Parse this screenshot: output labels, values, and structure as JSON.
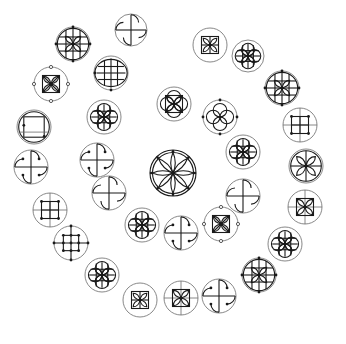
{
  "diagram": {
    "title": "",
    "background": "#ffffff",
    "stroke_color": "#1a1a1a",
    "outline_color": "#6a6a6a",
    "layout": "concentric-rings",
    "center_symbol": {
      "x": 173,
      "y": 173,
      "r": 23,
      "type": "rosette"
    },
    "symbols": [
      {
        "ring": "outer",
        "x": 73,
        "y": 44,
        "r": 17,
        "type": "lattice-petals"
      },
      {
        "ring": "outer",
        "x": 51,
        "y": 84,
        "r": 17,
        "type": "square-x-dots"
      },
      {
        "ring": "outer",
        "x": 131,
        "y": 30,
        "r": 16,
        "type": "pinwheel"
      },
      {
        "ring": "outer",
        "x": 210,
        "y": 45,
        "r": 17,
        "type": "square-pinwheel"
      },
      {
        "ring": "outer",
        "x": 248,
        "y": 56,
        "r": 16,
        "type": "lattice-petals-circles"
      },
      {
        "ring": "outer",
        "x": 282,
        "y": 88,
        "r": 17,
        "type": "lattice-petals"
      },
      {
        "ring": "outer",
        "x": 300,
        "y": 125,
        "r": 17,
        "type": "lattice-dots"
      },
      {
        "ring": "outer",
        "x": 306,
        "y": 166,
        "r": 17,
        "type": "petal-cross"
      },
      {
        "ring": "outer",
        "x": 305,
        "y": 207,
        "r": 17,
        "type": "square-x-cross"
      },
      {
        "ring": "outer",
        "x": 285,
        "y": 244,
        "r": 17,
        "type": "lattice-petals-circles"
      },
      {
        "ring": "outer",
        "x": 259,
        "y": 275,
        "r": 17,
        "type": "lattice-petals"
      },
      {
        "ring": "outer",
        "x": 219,
        "y": 296,
        "r": 17,
        "type": "pinwheel-dots"
      },
      {
        "ring": "outer",
        "x": 181,
        "y": 298,
        "r": 17,
        "type": "square-x-cross"
      },
      {
        "ring": "outer",
        "x": 140,
        "y": 300,
        "r": 17,
        "type": "square-pinwheel"
      },
      {
        "ring": "outer",
        "x": 102,
        "y": 275,
        "r": 17,
        "type": "lattice-petals-circles"
      },
      {
        "ring": "outer",
        "x": 71,
        "y": 243,
        "r": 17,
        "type": "lattice-dots-cross"
      },
      {
        "ring": "outer",
        "x": 50,
        "y": 210,
        "r": 17,
        "type": "lattice-dots"
      },
      {
        "ring": "outer",
        "x": 31,
        "y": 167,
        "r": 17,
        "type": "pinwheel-dots"
      },
      {
        "ring": "outer",
        "x": 34,
        "y": 127,
        "r": 17,
        "type": "square-circle"
      },
      {
        "ring": "middle",
        "x": 111,
        "y": 73,
        "r": 17,
        "type": "lattice-circle"
      },
      {
        "ring": "middle",
        "x": 104,
        "y": 117,
        "r": 17,
        "type": "lattice-petals-circles"
      },
      {
        "ring": "middle",
        "x": 97,
        "y": 160,
        "r": 17,
        "type": "pinwheel-dots"
      },
      {
        "ring": "middle",
        "x": 109,
        "y": 193,
        "r": 17,
        "type": "pinwheel"
      },
      {
        "ring": "middle",
        "x": 142,
        "y": 225,
        "r": 17,
        "type": "lattice-petals-circles"
      },
      {
        "ring": "middle",
        "x": 181,
        "y": 233,
        "r": 17,
        "type": "pinwheel-dots"
      },
      {
        "ring": "middle",
        "x": 221,
        "y": 224,
        "r": 17,
        "type": "square-x-dots"
      },
      {
        "ring": "middle",
        "x": 243,
        "y": 196,
        "r": 17,
        "type": "pinwheel"
      },
      {
        "ring": "middle",
        "x": 243,
        "y": 152,
        "r": 17,
        "type": "lattice-petals-circles"
      },
      {
        "ring": "middle",
        "x": 220,
        "y": 117,
        "r": 17,
        "type": "four-circles"
      },
      {
        "ring": "middle",
        "x": 174,
        "y": 104,
        "r": 17,
        "type": "square-circles-petals"
      }
    ]
  }
}
